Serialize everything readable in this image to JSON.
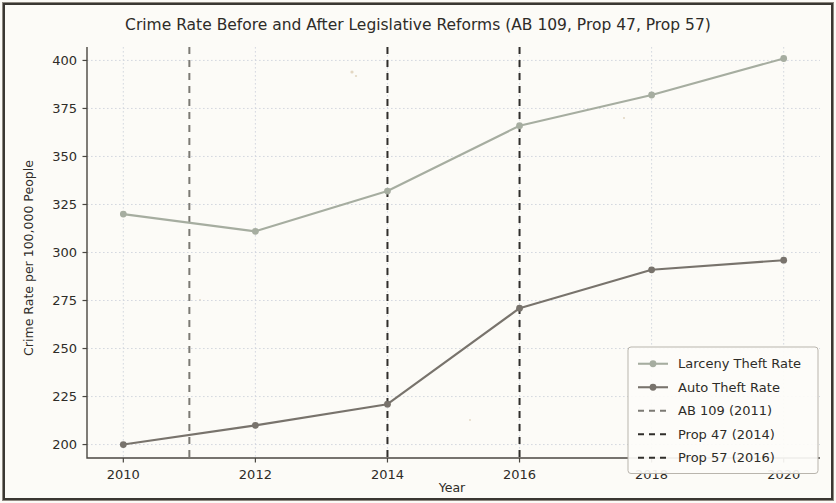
{
  "chart_data": {
    "type": "line",
    "title": "Crime Rate Before and After Legislative Reforms (AB 109, Prop 47, Prop 57)",
    "xlabel": "Year",
    "ylabel": "Crime Rate per 100,000 People",
    "x": [
      2010,
      2012,
      2014,
      2016,
      2018,
      2020
    ],
    "xticks": [
      "2010",
      "2012",
      "2014",
      "2016",
      "2018",
      "2020"
    ],
    "yticks": [
      "200",
      "225",
      "250",
      "275",
      "300",
      "325",
      "350",
      "375",
      "400"
    ],
    "ytickvalues": [
      200,
      225,
      250,
      275,
      300,
      325,
      350,
      375,
      400
    ],
    "xlim": [
      2009.45,
      2020.55
    ],
    "ylim": [
      193.0,
      407.0
    ],
    "grid": true,
    "legend_position": "lower right",
    "series": [
      {
        "name": "Larceny Theft Rate",
        "values": [
          320,
          311,
          332,
          366,
          382,
          401
        ],
        "color": "#a6ada0",
        "marker": "circle"
      },
      {
        "name": "Auto Theft Rate",
        "values": [
          200,
          210,
          221,
          271,
          291,
          296
        ],
        "color": "#78736c",
        "marker": "circle"
      }
    ],
    "vlines": [
      {
        "label": "AB 109 (2011)",
        "x": 2011,
        "color": "#7c7a74",
        "style": "dashed"
      },
      {
        "label": "Prop 47 (2014)",
        "x": 2014,
        "color": "#302e2b",
        "style": "dashed"
      },
      {
        "label": "Prop 57 (2016)",
        "x": 2016,
        "color": "#302e2b",
        "style": "dashed"
      }
    ],
    "legend_entries": [
      "Larceny Theft Rate",
      "Auto Theft Rate",
      "AB 109 (2011)",
      "Prop 47 (2014)",
      "Prop 57 (2016)"
    ]
  }
}
